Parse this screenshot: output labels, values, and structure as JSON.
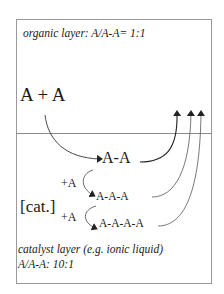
{
  "diagram": {
    "organic_layer": {
      "label": "organic layer: A/A-A= 1:1"
    },
    "reactants": "A + A",
    "catalyst": "[cat.]",
    "products": {
      "dimer": "A-A",
      "trimer": "A-A-A",
      "tetramer": "A-A-A-A"
    },
    "additions": [
      "+A",
      "+A"
    ],
    "catalyst_layer": {
      "label_line1": "catalyst layer (e.g. ionic liquid)",
      "label_line2": "A/A-A: 10:1"
    },
    "colors": {
      "text": "#1a1a1a",
      "border": "#9a9a9a",
      "arrow": "#222222"
    }
  }
}
